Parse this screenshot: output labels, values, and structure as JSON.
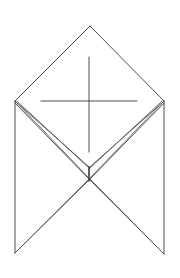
{
  "figure": {
    "stroke_color": "#3a3a3a",
    "background": "#ffffff",
    "points": {
      "apex": [
        90,
        26
      ],
      "left_corner": [
        15,
        101
      ],
      "right_corner": [
        164,
        101
      ],
      "bottom_left": [
        15,
        253
      ],
      "bottom_right": [
        164,
        254
      ],
      "inner_v": [
        90,
        168
      ],
      "crossing": [
        90,
        180
      ]
    },
    "cross": {
      "horizontal": [
        [
          41,
          101
        ],
        [
          137,
          101
        ]
      ],
      "vertical": [
        [
          89,
          57
        ],
        [
          89,
          152
        ]
      ]
    }
  }
}
